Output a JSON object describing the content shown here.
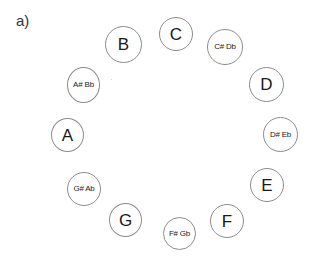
{
  "panel_label": "a)",
  "diagram": {
    "notes": [
      {
        "name": "C",
        "type": "natural"
      },
      {
        "name": "C# Db",
        "type": "accidental"
      },
      {
        "name": "D",
        "type": "natural"
      },
      {
        "name": "D# Eb",
        "type": "accidental"
      },
      {
        "name": "E",
        "type": "natural"
      },
      {
        "name": "F",
        "type": "natural"
      },
      {
        "name": "F# Gb",
        "type": "accidental"
      },
      {
        "name": "G",
        "type": "natural"
      },
      {
        "name": "G# Ab",
        "type": "accidental"
      },
      {
        "name": "A",
        "type": "natural"
      },
      {
        "name": "A# Bb",
        "type": "accidental"
      },
      {
        "name": "B",
        "type": "natural"
      }
    ]
  }
}
